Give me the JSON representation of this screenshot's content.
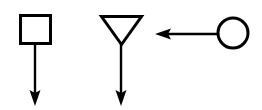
{
  "canvas": {
    "width": 262,
    "height": 110,
    "background_color": "#ffffff",
    "stroke_color": "#000000",
    "fill_color": "#ffffff"
  },
  "diagram": {
    "type": "petri-net-fragment",
    "nodes": [
      {
        "id": "square-node",
        "icon": "square-shape",
        "shape": "square",
        "label": "",
        "x": 19,
        "y": 14,
        "width": 33,
        "height": 31
      },
      {
        "id": "triangle-node",
        "icon": "triangle-down-shape",
        "shape": "triangle-down",
        "label": "",
        "x": 100,
        "y": 15,
        "width": 43,
        "height": 31
      },
      {
        "id": "circle-node",
        "icon": "circle-shape",
        "shape": "circle",
        "label": "",
        "cx": 233,
        "cy": 33,
        "r": 16
      }
    ],
    "edges": [
      {
        "id": "edge-square-down",
        "icon": "arrow-down-icon",
        "label": "",
        "direction": "down",
        "from": "square-node",
        "to": "",
        "x1": 35,
        "y1": 45,
        "x2": 35,
        "y2": 106
      },
      {
        "id": "edge-triangle-down",
        "icon": "arrow-down-icon",
        "label": "",
        "direction": "down",
        "from": "triangle-node",
        "to": "",
        "x1": 121,
        "y1": 46,
        "x2": 121,
        "y2": 106
      },
      {
        "id": "edge-circle-left",
        "icon": "arrow-left-icon",
        "label": "",
        "direction": "left",
        "from": "circle-node",
        "to": "",
        "x1": 217,
        "y1": 34,
        "x2": 155,
        "y2": 34
      }
    ]
  }
}
